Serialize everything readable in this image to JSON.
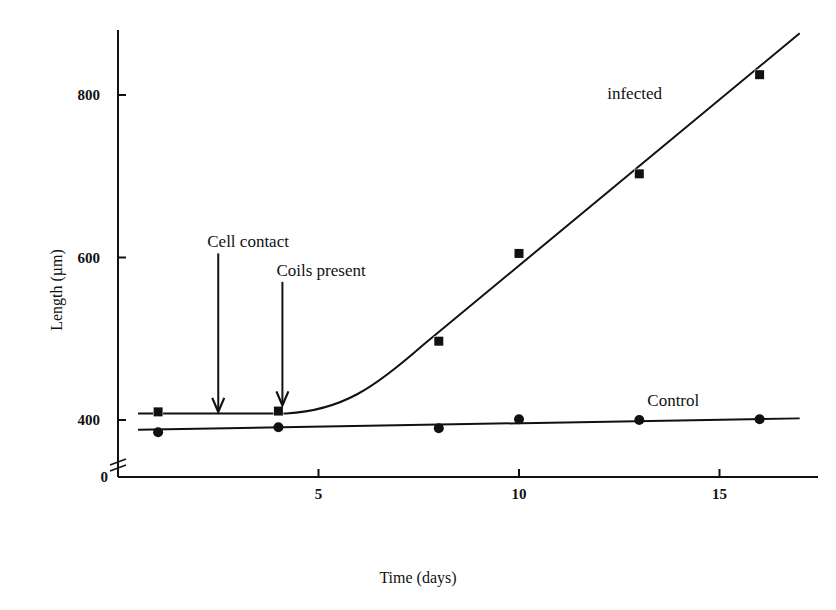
{
  "chart_data": {
    "type": "line",
    "title": "",
    "xlabel": "Time (days)",
    "ylabel": "Length (µm)",
    "xlim": [
      0,
      17
    ],
    "ylim": [
      0,
      880
    ],
    "y_axis_break": true,
    "xticks": [
      0,
      5,
      10,
      15
    ],
    "xtick_labels": [
      "",
      "5",
      "10",
      "15"
    ],
    "yticks": [
      0,
      400,
      600,
      800
    ],
    "ytick_labels": [
      "0",
      "400",
      "600",
      "800"
    ],
    "grid": false,
    "series": [
      {
        "name": "infected",
        "marker": "square",
        "x": [
          1,
          4,
          8,
          10,
          13,
          16
        ],
        "values": [
          410,
          411,
          497,
          605,
          703,
          825
        ],
        "label_pos": {
          "x": 12.2,
          "y": 800
        }
      },
      {
        "name": "Control",
        "marker": "circle",
        "x": [
          1,
          4,
          8,
          10,
          13,
          16
        ],
        "values": [
          385,
          391,
          390,
          401,
          400,
          401
        ],
        "label_pos": {
          "x": 13.2,
          "y": 420
        }
      }
    ],
    "annotations": [
      {
        "text": "Cell contact",
        "x": 2.5,
        "arrow_from": 605,
        "arrow_to": 410
      },
      {
        "text": "Coils present",
        "x": 4.1,
        "arrow_from": 570,
        "arrow_to": 418
      }
    ]
  }
}
